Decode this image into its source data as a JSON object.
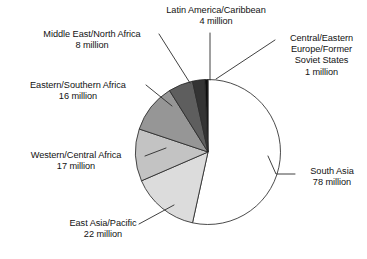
{
  "figure": {
    "background_color": "#ffffff",
    "width": 367,
    "height": 259
  },
  "chart_data": {
    "type": "pie",
    "title": "",
    "subtitle": "",
    "xlabel": "",
    "ylabel": "",
    "unit": "million",
    "total": 146,
    "legend_position": "none",
    "labels_position": "outside-with-leader-lines",
    "grid": false,
    "start_angle_deg": 0,
    "direction": "clockwise",
    "categories": [
      "South Asia",
      "East Asia/Pacific",
      "Western/Central Africa",
      "Eastern/Southern Africa",
      "Middle East/North Africa",
      "Latin America/Caribbean",
      "Central/Eastern Europe/Former Soviet States"
    ],
    "values": [
      78,
      22,
      17,
      16,
      8,
      4,
      1
    ],
    "colors": [
      "#ffffff",
      "#dcdcdc",
      "#c3c3c3",
      "#969696",
      "#5e5e5e",
      "#343434",
      "#0d0d0d"
    ],
    "slices": [
      {
        "name": "south-asia",
        "label_lines": [
          "South Asia",
          "78 million"
        ],
        "category": "South Asia",
        "value": 78,
        "value_text": "78 million",
        "color": "#ffffff",
        "start_deg": 0.0,
        "end_deg": 192.33
      },
      {
        "name": "east-asia-pacific",
        "label_lines": [
          "East Asia/Pacific",
          "22 million"
        ],
        "category": "East Asia/Pacific",
        "value": 22,
        "value_text": "22 million",
        "color": "#dcdcdc",
        "start_deg": 192.33,
        "end_deg": 246.58
      },
      {
        "name": "western-central-africa",
        "label_lines": [
          "Western/Central Africa",
          "17 million"
        ],
        "category": "Western/Central Africa",
        "value": 17,
        "value_text": "17 million",
        "color": "#c3c3c3",
        "start_deg": 246.58,
        "end_deg": 288.49
      },
      {
        "name": "eastern-southern-africa",
        "label_lines": [
          "Eastern/Southern Africa",
          "16 million"
        ],
        "category": "Eastern/Southern Africa",
        "value": 16,
        "value_text": "16 million",
        "color": "#969696",
        "start_deg": 288.49,
        "end_deg": 327.94
      },
      {
        "name": "middle-east-north-africa",
        "label_lines": [
          "Middle East/North Africa",
          "8 million"
        ],
        "category": "Middle East/North Africa",
        "value": 8,
        "value_text": "8 million",
        "color": "#5e5e5e",
        "start_deg": 327.94,
        "end_deg": 347.67
      },
      {
        "name": "latin-america-caribbean",
        "label_lines": [
          "Latin America/Caribbean",
          "4 million"
        ],
        "category": "Latin America/Caribbean",
        "value": 4,
        "value_text": "4 million",
        "color": "#343434",
        "start_deg": 347.67,
        "end_deg": 357.53
      },
      {
        "name": "central-eastern-europe",
        "label_lines": [
          "Central/Eastern",
          "Europe/Former",
          "Soviet States",
          "1 million"
        ],
        "category": "Central/Eastern Europe/Former Soviet States",
        "value": 1,
        "value_text": "1 million",
        "color": "#0d0d0d",
        "start_deg": 357.53,
        "end_deg": 360.0
      }
    ]
  },
  "labels": {
    "latin_america": {
      "line1": "Latin America/Caribbean",
      "line2": "4 million"
    },
    "central_eastern_europe": {
      "line1": "Central/Eastern",
      "line2": "Europe/Former",
      "line3": "Soviet States",
      "line4": "1 million"
    },
    "middle_east_north_africa": {
      "line1": "Middle East/North Africa",
      "line2": "8 million"
    },
    "eastern_southern_africa": {
      "line1": "Eastern/Southern Africa",
      "line2": "16 million"
    },
    "western_central_africa": {
      "line1": "Western/Central Africa",
      "line2": "17 million"
    },
    "east_asia_pacific": {
      "line1": "East Asia/Pacific",
      "line2": "22 million"
    },
    "south_asia": {
      "line1": "South Asia",
      "line2": "78 million"
    }
  }
}
